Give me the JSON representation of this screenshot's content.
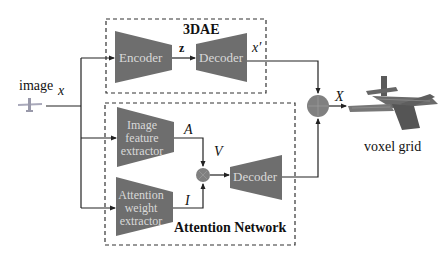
{
  "diagram": {
    "input": {
      "label": "image",
      "variable": "x"
    },
    "modules": {
      "dae": {
        "title": "3DAE",
        "encoder": "Encoder",
        "latent": "z",
        "decoder": "Decoder",
        "output": "x′"
      },
      "attention": {
        "title": "Attention Network",
        "feature_extractor": [
          "Image",
          "feature",
          "extractor"
        ],
        "feature_output": "A",
        "weight_extractor": [
          "Attention",
          "weight",
          "extractor"
        ],
        "weight_output": "I",
        "product": "V",
        "decoder": "Decoder"
      }
    },
    "operators": {
      "multiply": "⊗",
      "add": "⊕"
    },
    "output": {
      "variable": "X",
      "label": "voxel grid"
    },
    "colors": {
      "block_fill": "#6e6e6e",
      "block_text": "#d9d9d9",
      "line": "#222222",
      "operator_fill": "#808080",
      "dashed_border": "#333333"
    }
  }
}
